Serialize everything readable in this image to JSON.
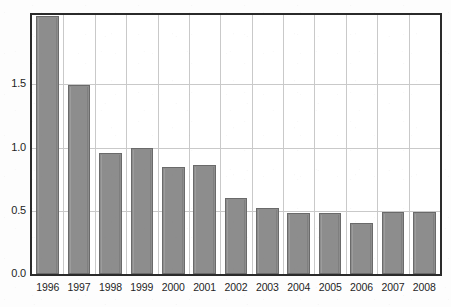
{
  "chart_data": {
    "type": "bar",
    "title": "",
    "subtitle": "",
    "xlabel": "",
    "ylabel": "",
    "categories": [
      "1996",
      "1997",
      "1998",
      "1999",
      "2000",
      "2001",
      "2002",
      "2003",
      "2004",
      "2005",
      "2006",
      "2007",
      "2008"
    ],
    "values": [
      2.04,
      1.5,
      0.96,
      1.0,
      0.85,
      0.86,
      0.6,
      0.52,
      0.48,
      0.48,
      0.4,
      0.49,
      0.49
    ],
    "series": [
      {
        "name": "",
        "values": [
          2.04,
          1.5,
          0.96,
          1.0,
          0.85,
          0.86,
          0.6,
          0.52,
          0.48,
          0.48,
          0.4,
          0.49,
          0.49
        ]
      }
    ],
    "ylim": [
      0.0,
      2.05
    ],
    "yticks": [
      0.0,
      0.5,
      1.0,
      1.5
    ],
    "ytick_labels": [
      "0.0",
      "0.5",
      "1.0",
      "1.5"
    ],
    "xtick_labels": [
      "1996",
      "1997",
      "1998",
      "1999",
      "2000",
      "2001",
      "2002",
      "2003",
      "2004",
      "2005",
      "2006",
      "2007",
      "2008"
    ],
    "grid": true,
    "grid_axis": "both",
    "legend": false,
    "legend_position": "none",
    "annotations": [],
    "colors": {
      "bar_fill": "#8d8d8d",
      "bar_edge": "#6a6a6a",
      "grid": "#c9c9c9",
      "frame": "#2a2a2a",
      "background": "#ffffff",
      "text": "#1f1f1f"
    }
  }
}
